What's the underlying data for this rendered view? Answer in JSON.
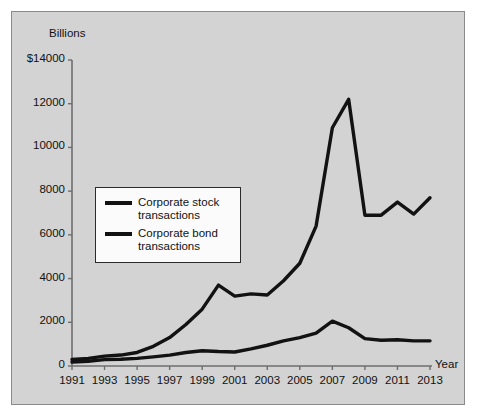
{
  "chart_data": {
    "type": "line",
    "title": "",
    "subtitle": "",
    "ylabel": "Billions",
    "xlabel": "Year",
    "ylim": [
      0,
      14000
    ],
    "xlim": [
      1991,
      2013
    ],
    "grid": false,
    "legend_position": "upper-left-inside",
    "y_ticks": [
      "$14000",
      "12000",
      "10000",
      "8000",
      "6000",
      "4000",
      "2000",
      "0"
    ],
    "y_tick_values": [
      14000,
      12000,
      10000,
      8000,
      6000,
      4000,
      2000,
      0
    ],
    "x_ticks": [
      "1991",
      "1993",
      "1995",
      "1997",
      "1999",
      "2001",
      "2003",
      "2005",
      "2007",
      "2009",
      "2011",
      "2013"
    ],
    "x": [
      1991,
      1992,
      1993,
      1994,
      1995,
      1996,
      1997,
      1998,
      1999,
      2000,
      2001,
      2002,
      2003,
      2004,
      2005,
      2006,
      2007,
      2008,
      2009,
      2010,
      2011,
      2012,
      2013
    ],
    "series": [
      {
        "name": "Corporate stock transactions",
        "color": "#121212",
        "values": [
          300,
          350,
          450,
          500,
          620,
          900,
          1300,
          1900,
          2600,
          3700,
          3200,
          3300,
          3250,
          3900,
          4700,
          6400,
          10900,
          12200,
          6900,
          6900,
          7500,
          6950,
          7700
        ]
      },
      {
        "name": "Corporate bond transactions",
        "color": "#121212",
        "values": [
          180,
          220,
          290,
          310,
          350,
          420,
          500,
          620,
          700,
          660,
          640,
          780,
          950,
          1150,
          1300,
          1500,
          2050,
          1750,
          1250,
          1180,
          1200,
          1150,
          1150
        ]
      }
    ]
  },
  "legend": {
    "items": [
      {
        "label_line1": "Corporate stock",
        "label_line2": "transactions"
      },
      {
        "label_line1": "Corporate bond",
        "label_line2": "transactions"
      }
    ]
  },
  "colors": {
    "panel_background": "#d3d3d3",
    "axis": "#6e6e6e",
    "line": "#121212",
    "legend_background": "#fbfbfb",
    "text": "#111111"
  }
}
